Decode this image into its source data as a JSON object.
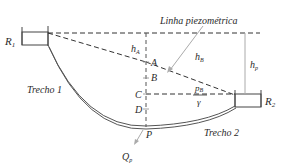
{
  "diagram": {
    "title_label": "Linha piezométrica",
    "reservoirs": [
      {
        "id": "R1",
        "label": "R",
        "sub": "1"
      },
      {
        "id": "R2",
        "label": "R",
        "sub": "2"
      }
    ],
    "points": [
      "A",
      "B",
      "C",
      "D",
      "P"
    ],
    "heads": {
      "hA": {
        "label": "h",
        "sub": "A"
      },
      "hB": {
        "label": "h",
        "sub": "B"
      },
      "hp": {
        "label": "h",
        "sub": "p"
      }
    },
    "pressure_term": {
      "numerator": "p",
      "num_sub": "B",
      "denominator": "γ"
    },
    "segments": [
      "Trecho 1",
      "Trecho 2"
    ],
    "flow": {
      "label": "Q",
      "sub": "p"
    },
    "colors": {
      "line": "#333333",
      "pipe": "#555555",
      "guide": "#aaaaaa"
    }
  }
}
